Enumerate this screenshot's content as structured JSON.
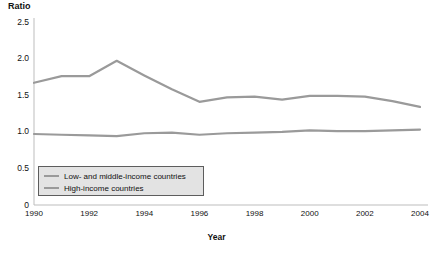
{
  "chart_data": {
    "type": "line",
    "title": "",
    "ylabel": "Ratio",
    "xlabel": "Year",
    "ylim": [
      0,
      2.5
    ],
    "yticks": [
      "0",
      "0.5",
      "1.0",
      "1.5",
      "2.0",
      "2.5"
    ],
    "ytick_values": [
      0,
      0.5,
      1.0,
      1.5,
      2.0,
      2.5
    ],
    "xlim": [
      1990,
      2004
    ],
    "xticks": [
      "1990",
      "1992",
      "1994",
      "1996",
      "1998",
      "2000",
      "2002",
      "2004"
    ],
    "xtick_values": [
      1990,
      1992,
      1994,
      1996,
      1998,
      2000,
      2002,
      2004
    ],
    "x": [
      1990,
      1991,
      1992,
      1993,
      1994,
      1995,
      1996,
      1997,
      1998,
      1999,
      2000,
      2001,
      2002,
      2003,
      2004
    ],
    "grid": false,
    "legend_position": "lower-left",
    "series": [
      {
        "name": "Low- and middle-income countries",
        "color": "#9a9a9a",
        "values": [
          1.67,
          1.76,
          1.76,
          1.97,
          1.77,
          1.58,
          1.41,
          1.47,
          1.48,
          1.44,
          1.49,
          1.49,
          1.48,
          1.42,
          1.34
        ]
      },
      {
        "name": "High-income countries",
        "color": "#9a9a9a",
        "values": [
          0.97,
          0.96,
          0.95,
          0.94,
          0.98,
          0.99,
          0.96,
          0.98,
          0.99,
          1.0,
          1.02,
          1.01,
          1.01,
          1.02,
          1.03
        ]
      }
    ]
  },
  "legend": {
    "items": [
      {
        "label": "Low- and middle-income countries"
      },
      {
        "label": "High-income countries"
      }
    ]
  }
}
